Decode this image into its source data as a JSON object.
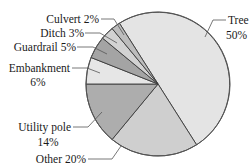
{
  "chart_data": {
    "type": "pie",
    "title": "",
    "categories": [
      "Tree",
      "Other",
      "Utility pole",
      "Embankment",
      "Guardrail",
      "Ditch",
      "Culvert"
    ],
    "values": [
      50,
      20,
      14,
      6,
      5,
      3,
      2
    ],
    "unit": "%",
    "colors": [
      "#e4e4e4",
      "#cfcfcf",
      "#adadad",
      "#e6e6e6",
      "#a4a4a4",
      "#d2d2d2",
      "#bdbdbd"
    ],
    "labels": [
      {
        "name": "Tree",
        "line1": "Tree",
        "line2": "50%"
      },
      {
        "name": "Other",
        "line1": "Other 20%",
        "line2": ""
      },
      {
        "name": "Utility pole",
        "line1": "Utility pole",
        "line2": "14%"
      },
      {
        "name": "Embankment",
        "line1": "Embankment",
        "line2": "6%"
      },
      {
        "name": "Guardrail",
        "line1": "Guardrail 5%",
        "line2": ""
      },
      {
        "name": "Ditch",
        "line1": "Ditch 3%",
        "line2": ""
      },
      {
        "name": "Culvert",
        "line1": "Culvert 2%",
        "line2": ""
      }
    ],
    "legend": "none (callout labels with leader lines)",
    "start_angle_deg": -122.4,
    "direction": "clockwise"
  }
}
